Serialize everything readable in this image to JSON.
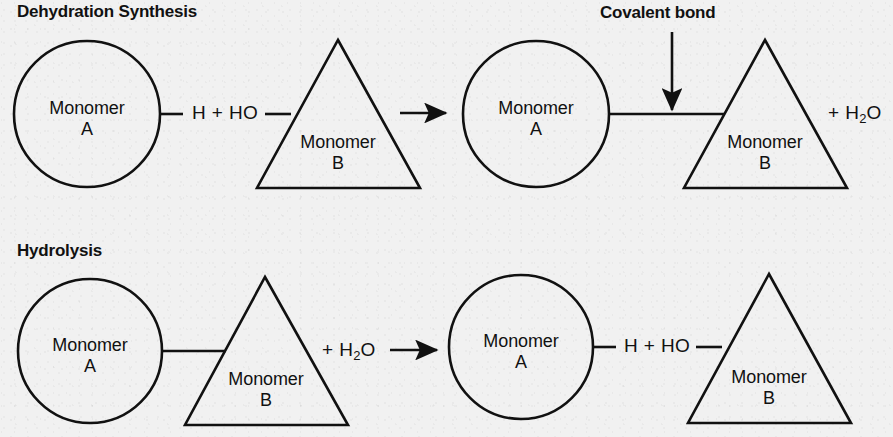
{
  "figure": {
    "title_top": "Dehydration Synthesis",
    "title_bottom": "Hydrolysis",
    "annotation": "Covalent bond",
    "background_color": "#f1f1f1",
    "ink_color": "#111111"
  },
  "labels": {
    "monomer_a_line1": "Monomer",
    "monomer_a_line2": "A",
    "monomer_b_line1": "Monomer",
    "monomer_b_line2": "B",
    "h_plus_ho": "H + HO",
    "plus_water_prefix": "+ H",
    "water_sub": "2",
    "water_suffix": "O"
  },
  "dehydration_synthesis": {
    "heading": "Dehydration Synthesis",
    "reactants": [
      {
        "shape": "circle",
        "line1": "Monomer",
        "line2": "A"
      },
      {
        "shape": "triangle",
        "line1": "Monomer",
        "line2": "B"
      }
    ],
    "reactant_bond_text": "H + HO",
    "arrow": "right-arrow",
    "products": [
      {
        "shape": "circle",
        "line1": "Monomer",
        "line2": "A"
      },
      {
        "shape": "triangle",
        "line1": "Monomer",
        "line2": "B"
      }
    ],
    "product_side_text": "+ H2O",
    "callout": {
      "text": "Covalent bond",
      "pointer": "down-arrow"
    }
  },
  "hydrolysis": {
    "heading": "Hydrolysis",
    "reactants": [
      {
        "shape": "circle",
        "line1": "Monomer",
        "line2": "A"
      },
      {
        "shape": "triangle",
        "line1": "Monomer",
        "line2": "B"
      }
    ],
    "reactant_side_text": "+ H2O",
    "arrow": "right-arrow",
    "products": [
      {
        "shape": "circle",
        "line1": "Monomer",
        "line2": "A"
      },
      {
        "shape": "triangle",
        "line1": "Monomer",
        "line2": "B"
      }
    ],
    "product_bond_text": "H + HO"
  }
}
